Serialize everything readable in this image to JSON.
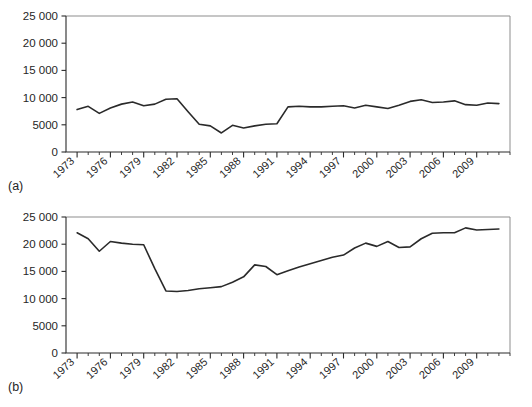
{
  "figure": {
    "panels": [
      {
        "tag": "(a)",
        "chart_data": {
          "type": "line",
          "title": "",
          "xlabel": "",
          "ylabel": "",
          "xlim": [
            1972,
            2012
          ],
          "ylim": [
            0,
            25000
          ],
          "grid": false,
          "legend": "none",
          "ytick_labels": [
            "0",
            "5000",
            "10 000",
            "15 000",
            "20 000",
            "25 000"
          ],
          "ytick_values": [
            0,
            5000,
            10000,
            15000,
            20000,
            25000
          ],
          "xtick_labels": [
            "1973",
            "1976",
            "1979",
            "1982",
            "1985",
            "1988",
            "1991",
            "1994",
            "1997",
            "2000",
            "2003",
            "2006",
            "2009"
          ],
          "xtick_values": [
            1973,
            1976,
            1979,
            1982,
            1985,
            1988,
            1991,
            1994,
            1997,
            2000,
            2003,
            2006,
            2009
          ],
          "minor_tick_interval": 1,
          "x": [
            1973,
            1974,
            1975,
            1976,
            1977,
            1978,
            1979,
            1980,
            1981,
            1982,
            1983,
            1984,
            1985,
            1986,
            1987,
            1988,
            1989,
            1990,
            1991,
            1992,
            1993,
            1994,
            1995,
            1996,
            1997,
            1998,
            1999,
            2000,
            2001,
            2002,
            2003,
            2004,
            2005,
            2006,
            2007,
            2008,
            2009,
            2010,
            2011
          ],
          "values": [
            7800,
            8400,
            7100,
            8100,
            8800,
            9200,
            8500,
            8800,
            9700,
            9800,
            7400,
            5100,
            4800,
            3500,
            4900,
            4400,
            4800,
            5100,
            5200,
            8300,
            8400,
            8300,
            8300,
            8400,
            8500,
            8100,
            8600,
            8300,
            8000,
            8600,
            9300,
            9600,
            9100,
            9200,
            9400,
            8700,
            8600,
            9000,
            8900
          ]
        }
      },
      {
        "tag": "(b)",
        "chart_data": {
          "type": "line",
          "title": "",
          "xlabel": "",
          "ylabel": "",
          "xlim": [
            1972,
            2012
          ],
          "ylim": [
            0,
            25000
          ],
          "grid": false,
          "legend": "none",
          "ytick_labels": [
            "0",
            "5000",
            "10 000",
            "15 000",
            "20 000",
            "25 000"
          ],
          "ytick_values": [
            0,
            5000,
            10000,
            15000,
            20000,
            25000
          ],
          "xtick_labels": [
            "1973",
            "1976",
            "1979",
            "1982",
            "1985",
            "1988",
            "1991",
            "1994",
            "1997",
            "2000",
            "2003",
            "2006",
            "2009"
          ],
          "xtick_values": [
            1973,
            1976,
            1979,
            1982,
            1985,
            1988,
            1991,
            1994,
            1997,
            2000,
            2003,
            2006,
            2009
          ],
          "minor_tick_interval": 1,
          "x": [
            1973,
            1974,
            1975,
            1976,
            1977,
            1978,
            1979,
            1980,
            1981,
            1982,
            1983,
            1984,
            1985,
            1986,
            1987,
            1988,
            1989,
            1990,
            1991,
            1992,
            1993,
            1994,
            1995,
            1996,
            1997,
            1998,
            1999,
            2000,
            2001,
            2002,
            2003,
            2004,
            2005,
            2006,
            2007,
            2008,
            2009,
            2010,
            2011
          ],
          "values": [
            22100,
            21000,
            18700,
            20500,
            20200,
            20000,
            19900,
            15500,
            11400,
            11300,
            11500,
            11800,
            12000,
            12200,
            13000,
            14000,
            16200,
            15900,
            14400,
            15100,
            15800,
            16400,
            17000,
            17600,
            18000,
            19300,
            20200,
            19600,
            20500,
            19400,
            19500,
            21000,
            22000,
            22100,
            22100,
            23000,
            22600,
            22700,
            22800
          ]
        }
      }
    ]
  }
}
